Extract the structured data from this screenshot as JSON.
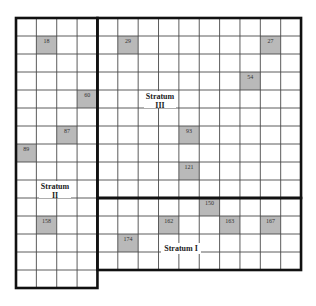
{
  "diagram": {
    "title": "",
    "grid": {
      "origin_x": 16,
      "origin_y": 18,
      "columns": 14,
      "rows": 15,
      "col_width": 20.36,
      "row_height": 18,
      "line_color": "#4a4a4a",
      "border_color": "#111111",
      "shade_color": "#b9b9b9",
      "background": "#ffffff"
    },
    "strata": [
      {
        "id": "stratum-1",
        "label_line1": "Stratum I",
        "label_line2": "",
        "col_start": 4,
        "col_end": 14,
        "row_start": 10,
        "row_end": 14,
        "label_x": 181,
        "label_y": 243,
        "label_w": 40,
        "label_h": 11
      },
      {
        "id": "stratum-2",
        "label_line1": "Stratum",
        "label_line2": "II",
        "col_start": 0,
        "col_end": 4,
        "row_start": 0,
        "row_end": 15,
        "label_x": 55,
        "label_y": 181,
        "label_w": 32,
        "label_h": 17
      },
      {
        "id": "stratum-3",
        "label_line1": "Stratum",
        "label_line2": "III",
        "col_start": 4,
        "col_end": 14,
        "row_start": 0,
        "row_end": 10,
        "label_x": 160,
        "label_y": 91,
        "label_w": 32,
        "label_h": 17
      }
    ],
    "sampled_cells": [
      {
        "label": "18",
        "col": 1,
        "row": 1
      },
      {
        "label": "29",
        "col": 5,
        "row": 1
      },
      {
        "label": "27",
        "col": 12,
        "row": 1
      },
      {
        "label": "54",
        "col": 11,
        "row": 3
      },
      {
        "label": "60",
        "col": 3,
        "row": 4
      },
      {
        "label": "87",
        "col": 2,
        "row": 6
      },
      {
        "label": "93",
        "col": 8,
        "row": 6
      },
      {
        "label": "89",
        "col": 0,
        "row": 7
      },
      {
        "label": "121",
        "col": 8,
        "row": 8
      },
      {
        "label": "150",
        "col": 9,
        "row": 10
      },
      {
        "label": "158",
        "col": 1,
        "row": 11
      },
      {
        "label": "162",
        "col": 7,
        "row": 11
      },
      {
        "label": "163",
        "col": 10,
        "row": 11
      },
      {
        "label": "167",
        "col": 12,
        "row": 11
      },
      {
        "label": "174",
        "col": 5,
        "row": 12
      }
    ]
  }
}
